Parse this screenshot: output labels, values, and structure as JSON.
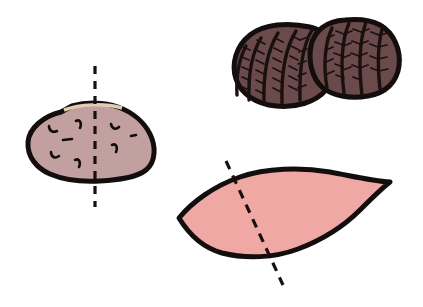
{
  "figure": {
    "background_color": "#ffffff",
    "width": 423,
    "height": 307,
    "object_count": 3
  },
  "palette": {
    "outline": "#140d0d",
    "potato_fill": "#c2a0a0",
    "potato_highlight": "#e2cdb4",
    "shell_fill": "#6a4a4a",
    "shell_rib": "#1a1010",
    "leaf_fill": "#f0a8a5",
    "cut_line": "#181010",
    "background": "#ffffff"
  },
  "objects": {
    "potato": {
      "label": "potato-tuber",
      "fill": "#c2a0a0",
      "outline": "#140d0d",
      "outline_width": 5,
      "path": "M 61 112 C 44 116 29 128 28 142 C 27 156 36 168 50 174 C 64 180 82 182 100 181 C 118 180 136 178 146 170 C 156 162 156 146 150 134 C 144 122 132 112 118 107 C 104 102 86 102 72 106 Z",
      "highlight_path": "M 64 110 C 80 104 104 103 122 108",
      "eyes": [
        {
          "name": "eye-mark-1",
          "path": "M 49 126 C 49 131 53 133 57 131",
          "width": 2.6
        },
        {
          "name": "eye-mark-2",
          "path": "M 76 121 C 80 119 82 123 80 128",
          "width": 2.6
        },
        {
          "name": "eye-mark-3",
          "path": "M 63 140 L 72 139",
          "width": 2.6
        },
        {
          "name": "eye-mark-4",
          "path": "M 51 152 C 51 157 55 159 59 156",
          "width": 2.6
        },
        {
          "name": "eye-mark-5",
          "path": "M 75 160 C 79 158 81 162 79 167",
          "width": 2.6
        },
        {
          "name": "eye-mark-6",
          "path": "M 111 124 C 112 129 116 130 119 127",
          "width": 2.6
        },
        {
          "name": "eye-mark-7",
          "path": "M 131 136 L 136 135",
          "width": 2.6
        },
        {
          "name": "eye-mark-8",
          "path": "M 112 145 C 116 143 118 147 116 152",
          "width": 2.6
        }
      ],
      "symmetry_line": {
        "name": "vertical-symmetry-axis",
        "orientation": "vertical",
        "x1": 95,
        "y1": 66,
        "x2": 95,
        "y2": 207,
        "dash": "8 7",
        "width": 3.2
      }
    },
    "shells": {
      "label": "paired-shells",
      "fill": "#6a4a4a",
      "outline": "#140d0d",
      "outline_width": 5,
      "left": {
        "name": "shell-left",
        "path": "M 310 27 C 288 22 264 24 250 35 C 236 46 231 64 236 79 C 241 94 256 104 276 106 C 296 108 316 102 326 90 C 336 78 336 58 330 44 C 326 35 320 29 310 27 Z",
        "ribs": [
          "M 312 30 C 303 45 299 66 300 100",
          "M 296 31 C 286 47 281 68 282 103",
          "M 278 33 C 268 49 263 70 264 103",
          "M 261 38 C 252 53 248 72 249 100",
          "M 246 46 C 239 59 236 76 237 95"
        ],
        "rib_barbs": [
          "M 300 40 L 292 36 M 299 50 L 291 46 M 298 60 L 290 56 M 297 70 L 289 66 M 297 80 L 289 76 M 297 90 L 289 86",
          "M 283 42 L 275 38 M 282 52 L 274 48 M 281 62 L 273 58 M 281 72 L 273 68 M 281 82 L 273 78 M 281 92 L 273 88",
          "M 265 44 L 257 40 M 264 54 L 256 50 M 264 64 L 256 60 M 264 74 L 256 70 M 264 84 L 256 80 M 264 94 L 256 90",
          "M 250 50 L 243 47 M 249 60 L 242 57 M 249 70 L 242 67 M 249 80 L 242 77 M 249 90 L 242 87",
          "M 300 40 L 308 37 M 299 52 L 307 49 M 298 64 L 306 61 M 298 76 L 306 73 M 298 88 L 306 85"
        ]
      },
      "right": {
        "name": "shell-right",
        "path": "M 345 20 C 326 21 314 31 311 46 C 308 61 312 78 322 87 C 332 96 350 99 368 96 C 386 93 397 82 399 66 C 401 50 394 33 380 25 C 369 19 356 19 345 20 Z",
        "ribs": [
          "M 349 23 C 342 40 340 62 344 93",
          "M 366 22 C 360 39 358 62 362 95",
          "M 383 26 C 378 42 377 62 380 89",
          "M 332 28 C 325 44 323 64 327 88"
        ],
        "rib_barbs": [
          "M 344 34 L 336 31 M 343 45 L 335 42 M 342 56 L 334 53 M 343 67 L 335 64 M 344 78 L 336 75",
          "M 361 32 L 353 29 M 360 44 L 352 41 M 359 56 L 351 53 M 360 68 L 352 65 M 361 80 L 353 77",
          "M 379 35 L 371 32 M 378 47 L 370 44 M 378 59 L 370 56 M 379 71 L 371 68",
          "M 344 34 L 352 31 M 343 46 L 351 43 M 342 58 L 350 55 M 343 70 L 351 67",
          "M 361 32 L 369 29 M 360 44 L 368 41 M 359 56 L 367 53 M 360 68 L 368 65",
          "M 379 35 L 388 33 M 378 47 L 387 45 M 378 59 L 387 57 M 379 71 L 388 69",
          "M 327 38 L 334 35 M 326 50 L 333 47 M 326 62 L 333 59 M 327 74 L 334 71"
        ]
      }
    },
    "leaf": {
      "label": "leaf-blade",
      "fill": "#f0a8a5",
      "outline": "#140d0d",
      "outline_width": 5,
      "path": "M 179 218 C 192 202 214 186 240 177 C 266 168 300 167 330 172 C 352 176 372 181 390 182 C 382 188 372 198 360 210 C 344 226 322 240 298 249 C 274 258 246 259 222 253 C 204 248 190 236 179 218 Z",
      "symmetry_line": {
        "name": "oblique-symmetry-axis",
        "orientation": "oblique",
        "x1": 226,
        "y1": 161,
        "x2": 283,
        "y2": 285,
        "dash": "9 7",
        "width": 3.2
      }
    }
  }
}
